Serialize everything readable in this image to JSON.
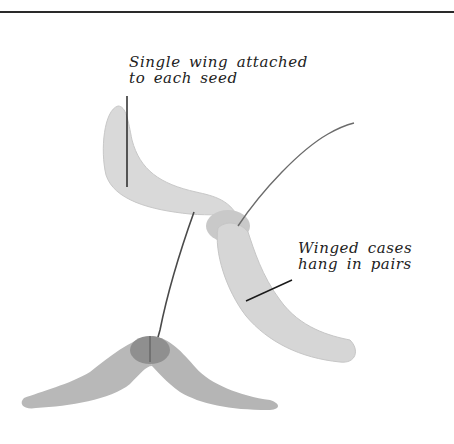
{
  "figure": {
    "annotations": [
      {
        "id": "single-wing",
        "lines": [
          "Single wing attached",
          "to each seed"
        ]
      },
      {
        "id": "winged-cases",
        "lines": [
          "Winged cases",
          "hang in pairs"
        ]
      }
    ]
  }
}
